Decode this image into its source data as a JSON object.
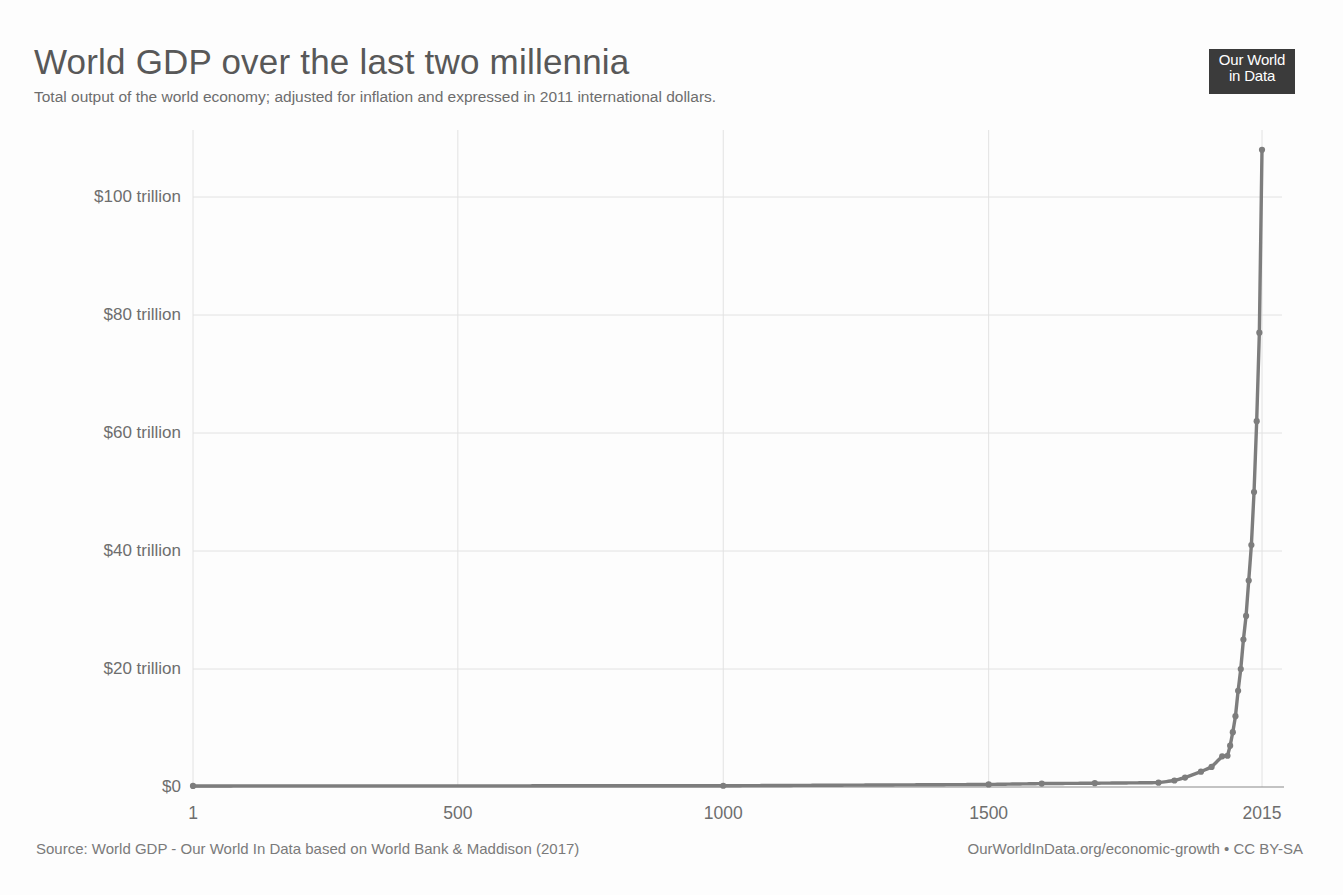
{
  "header": {
    "title": "World GDP over the last two millennia",
    "subtitle": "Total output of the world economy; adjusted for inflation and expressed in 2011 international dollars.",
    "logo_line1": "Our World",
    "logo_line2": "in Data"
  },
  "footer": {
    "source": "Source: World GDP - Our World In Data based on World Bank & Maddison (2017)",
    "license": "OurWorldInData.org/economic-growth • CC BY-SA"
  },
  "colors": {
    "line": "#7d7d7d",
    "grid": "#e2e2e2",
    "axis": "#6e6e6e",
    "title": "#585858",
    "logo_bg": "#3b3b3b",
    "background": "#fdfdfd"
  },
  "chart_data": {
    "type": "line",
    "title": "World GDP over the last two millennia",
    "subtitle": "Total output of the world economy; adjusted for inflation and expressed in 2011 international dollars.",
    "xlabel": "",
    "ylabel": "",
    "xlim": [
      1,
      2015
    ],
    "ylim": [
      0,
      110
    ],
    "y_unit": "trillion 2011 international dollars",
    "grid": true,
    "legend": false,
    "markers": true,
    "x_ticks": [
      1,
      500,
      1000,
      1500,
      2015
    ],
    "x_tick_labels": [
      "1",
      "500",
      "1000",
      "1500",
      "2015"
    ],
    "y_ticks": [
      0,
      20,
      40,
      60,
      80,
      100
    ],
    "y_tick_labels": [
      "$0",
      "$20 trillion",
      "$40 trillion",
      "$60 trillion",
      "$80 trillion",
      "$100 trillion"
    ],
    "series": [
      {
        "name": "World GDP",
        "x": [
          1,
          1000,
          1500,
          1600,
          1700,
          1820,
          1850,
          1870,
          1900,
          1920,
          1940,
          1950,
          1955,
          1960,
          1965,
          1970,
          1975,
          1980,
          1985,
          1990,
          1995,
          2000,
          2005,
          2010,
          2015
        ],
        "y": [
          0.18,
          0.21,
          0.43,
          0.58,
          0.64,
          0.74,
          1.1,
          1.6,
          2.6,
          3.4,
          5.2,
          5.3,
          7.0,
          9.3,
          12.0,
          16.3,
          20.0,
          25.0,
          29.0,
          35.0,
          41.0,
          50.0,
          62.0,
          77.0,
          108.0
        ]
      }
    ]
  },
  "plot_geometry": {
    "left": 193,
    "right": 1262,
    "top": 138,
    "bottom": 787
  }
}
